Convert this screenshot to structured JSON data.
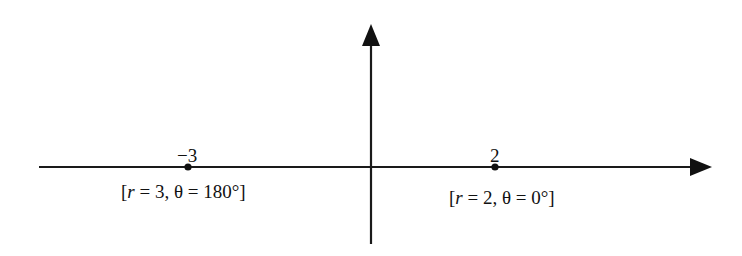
{
  "diagram": {
    "title": "",
    "axes": {
      "horizontal": {
        "x_start": 39,
        "x_end": 712,
        "y": 167,
        "arrow": "right"
      },
      "vertical": {
        "x": 371,
        "y_start": 244,
        "y_end": 24,
        "arrow": "up"
      },
      "color": "#1a1a1a"
    },
    "points": [
      {
        "value_label": "−3",
        "x": 188,
        "polar_open": "[",
        "r_var": "r",
        "polar_rest": " = 3, θ = 180°]",
        "polar_full": "[r = 3, θ = 180°]"
      },
      {
        "value_label": "2",
        "x": 495,
        "polar_open": "[",
        "r_var": "r",
        "polar_rest": " = 2, θ = 0°]",
        "polar_full": "[r = 2, θ = 0°]"
      }
    ]
  }
}
